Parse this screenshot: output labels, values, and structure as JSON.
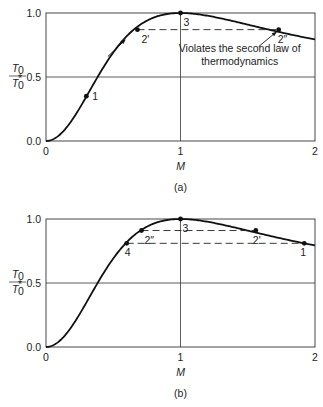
{
  "chart_data": [
    {
      "type": "line",
      "panel": "(a)",
      "title": "",
      "xlabel": "M",
      "ylabel": "T0 / T0*",
      "ylabel_num": "T0",
      "ylabel_den": "T0*",
      "xlim": [
        0,
        2
      ],
      "ylim": [
        0.0,
        1.0
      ],
      "xticks": [
        "0",
        "1",
        "2"
      ],
      "yticks": [
        "0.0",
        "0.5",
        "1.0"
      ],
      "grid": "lines at y=0.5 and x=1",
      "curve": "Rayleigh flow T0/T0* = 2(1+g)M^2(1+(g-1)/2 M^2)/(1+gM^2)^2, g=1.4",
      "points": [
        {
          "label": "1",
          "x": 0.3,
          "y": 0.35
        },
        {
          "label": "2'",
          "x": 0.68,
          "y": 0.87
        },
        {
          "label": "3",
          "x": 1.0,
          "y": 1.0
        },
        {
          "label": "2″",
          "x": 1.73,
          "y": 0.87
        }
      ],
      "dashed_lines": [
        {
          "from": "2'",
          "to": "2″",
          "y": 0.87
        }
      ],
      "annotation_line1": "Violates the second law of",
      "annotation_line2": "thermodynamics",
      "caption": "(a)"
    },
    {
      "type": "line",
      "panel": "(b)",
      "title": "",
      "xlabel": "M",
      "ylabel": "T0 / T0*",
      "ylabel_num": "T0",
      "ylabel_den": "T0*",
      "xlim": [
        0,
        2
      ],
      "ylim": [
        0.0,
        1.0
      ],
      "xticks": [
        "0",
        "1",
        "2"
      ],
      "yticks": [
        "0.0",
        "0.5",
        "1.0"
      ],
      "grid": "lines at y=0.5 and x=1",
      "curve": "Rayleigh flow T0/T0*, g=1.4",
      "points": [
        {
          "label": "4",
          "x": 0.6,
          "y": 0.81
        },
        {
          "label": "2″",
          "x": 0.71,
          "y": 0.91
        },
        {
          "label": "3",
          "x": 1.0,
          "y": 1.0
        },
        {
          "label": "2'",
          "x": 1.56,
          "y": 0.91
        },
        {
          "label": "1",
          "x": 1.92,
          "y": 0.81
        }
      ],
      "dashed_lines": [
        {
          "from": "2″",
          "to": "2'",
          "y": 0.91
        },
        {
          "from": "4",
          "to": "1",
          "y": 0.81
        }
      ],
      "caption": "(b)"
    }
  ]
}
